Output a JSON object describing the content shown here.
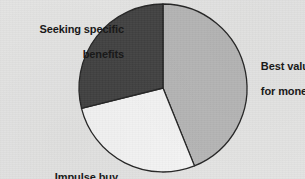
{
  "figure": {
    "background_color": "#e3e3e2",
    "label_color": "#191919"
  },
  "chart_data": {
    "type": "pie",
    "title": "",
    "subtitle": "",
    "xlabel": "",
    "ylabel": "",
    "grid": false,
    "legend_position": "none",
    "label_placement": "outside-callout",
    "center": {
      "x": 163,
      "y": 88
    },
    "radius": 84,
    "start_angle_deg": 0,
    "direction": "clockwise",
    "outline_color": "#242424",
    "outline_width": 1.3,
    "categories": [
      "Best value for money",
      "Impulse buy",
      "Seeking specific benefits"
    ],
    "values": [
      44,
      27,
      29
    ],
    "units": "percent",
    "slices": [
      {
        "label": "Best value for money",
        "label_line1": "Best value",
        "label_line2": "for money",
        "value": 44,
        "start_angle_deg": 0,
        "end_angle_deg": 158,
        "color": "#b5b5b5"
      },
      {
        "label": "Impulse buy",
        "label_line1": "Impulse buy",
        "label_line2": "",
        "value": 27,
        "start_angle_deg": 158,
        "end_angle_deg": 256,
        "color": "#f4f4f4"
      },
      {
        "label": "Seeking specific benefits",
        "label_line1": "Seeking specific",
        "label_line2": "benefits",
        "value": 29,
        "start_angle_deg": 256,
        "end_angle_deg": 360,
        "color": "#414141"
      }
    ]
  }
}
